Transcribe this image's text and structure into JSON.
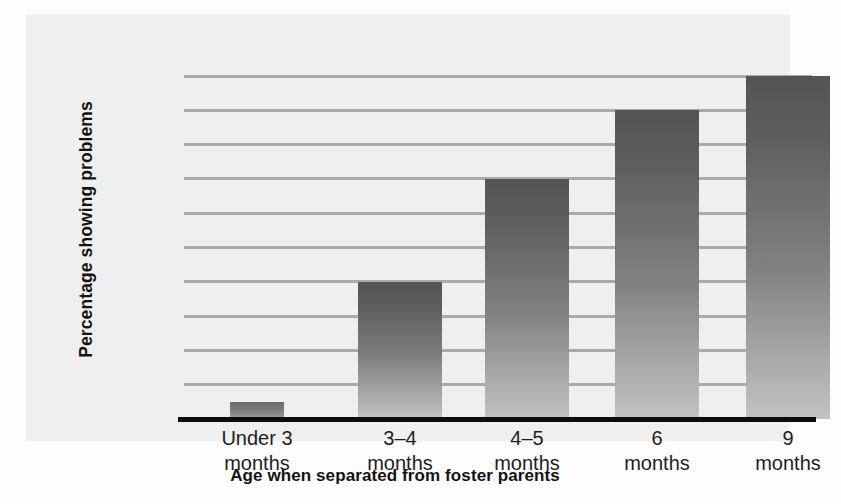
{
  "chart_data": {
    "type": "bar",
    "title": "",
    "subtitle": "",
    "xlabel": "Age when separated from foster parents",
    "ylabel": "Percentage showing problems",
    "categories": [
      "Under 3 months",
      "3–4 months",
      "4–5 months",
      "6 months",
      "9 months"
    ],
    "category_lines": [
      [
        "Under 3",
        "months"
      ],
      [
        "3–4",
        "months"
      ],
      [
        "4–5",
        "months"
      ],
      [
        "6",
        "months"
      ],
      [
        "9",
        "months"
      ]
    ],
    "values": [
      5,
      40,
      70,
      90,
      100
    ],
    "ylim": [
      0,
      100
    ],
    "ytick_values": [
      0,
      10,
      20,
      30,
      40,
      50,
      60,
      70,
      80,
      90,
      100
    ],
    "ytick_labels": [
      "0",
      "10",
      "20",
      "30",
      "40",
      "50",
      "60",
      "70",
      "80",
      "90",
      "100"
    ],
    "grid": true,
    "grid_axis": "y",
    "legend": false,
    "legend_position": "none"
  },
  "style": {
    "panel_background": "#eeefee",
    "page_background": "#fdfdfd",
    "gridline_color": "#a9aaa9",
    "axis_color": "#0d0d0d",
    "bar_gradient_top": "#545454",
    "bar_gradient_bottom": "#c2c2c2",
    "text_color": "#1d1d1d"
  }
}
